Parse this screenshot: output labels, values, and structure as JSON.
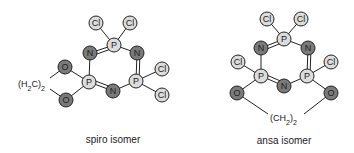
{
  "colors": {
    "dark_atom": "#7a7a7a",
    "light_atom": "#dcdcdc",
    "bond": "#222222"
  },
  "spiro": {
    "caption": "spiro isomer",
    "bridge_label": "(H2C)2",
    "atoms": [
      {
        "el": "Cl",
        "x": 96,
        "y": 23,
        "shade": "light"
      },
      {
        "el": "Cl",
        "x": 130,
        "y": 23,
        "shade": "light"
      },
      {
        "el": "P",
        "x": 114,
        "y": 45,
        "shade": "light"
      },
      {
        "el": "N",
        "x": 90,
        "y": 53,
        "shade": "dark"
      },
      {
        "el": "N",
        "x": 137,
        "y": 53,
        "shade": "dark"
      },
      {
        "el": "P",
        "x": 89,
        "y": 82,
        "shade": "light"
      },
      {
        "el": "P",
        "x": 136,
        "y": 81,
        "shade": "light"
      },
      {
        "el": "N",
        "x": 113,
        "y": 91,
        "shade": "dark"
      },
      {
        "el": "Cl",
        "x": 162,
        "y": 69,
        "shade": "light"
      },
      {
        "el": "Cl",
        "x": 162,
        "y": 95,
        "shade": "light"
      },
      {
        "el": "O",
        "x": 65,
        "y": 67,
        "shade": "dark"
      },
      {
        "el": "O",
        "x": 66,
        "y": 100,
        "shade": "dark"
      }
    ]
  },
  "ansa": {
    "caption": "ansa isomer",
    "bridge_label": "(CH2)2",
    "atoms": [
      {
        "el": "Cl",
        "x": 267,
        "y": 19,
        "shade": "light"
      },
      {
        "el": "Cl",
        "x": 301,
        "y": 19,
        "shade": "light"
      },
      {
        "el": "P",
        "x": 284,
        "y": 39,
        "shade": "light"
      },
      {
        "el": "N",
        "x": 261,
        "y": 48,
        "shade": "dark"
      },
      {
        "el": "N",
        "x": 308,
        "y": 48,
        "shade": "dark"
      },
      {
        "el": "P",
        "x": 261,
        "y": 76,
        "shade": "light"
      },
      {
        "el": "P",
        "x": 307,
        "y": 76,
        "shade": "light"
      },
      {
        "el": "N",
        "x": 284,
        "y": 86,
        "shade": "dark"
      },
      {
        "el": "Cl",
        "x": 238,
        "y": 62,
        "shade": "light"
      },
      {
        "el": "Cl",
        "x": 331,
        "y": 62,
        "shade": "light"
      },
      {
        "el": "O",
        "x": 237,
        "y": 93,
        "shade": "dark"
      },
      {
        "el": "O",
        "x": 331,
        "y": 93,
        "shade": "dark"
      }
    ]
  }
}
